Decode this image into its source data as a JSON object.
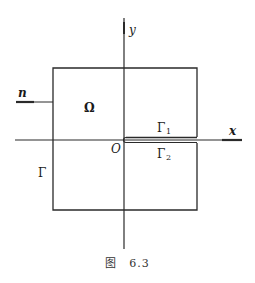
{
  "figure": {
    "caption_prefix": "图",
    "caption_number": "6.3",
    "labels": {
      "y_axis": "y",
      "x_axis": "x",
      "origin": "O",
      "domain": "Ω",
      "normal": "n",
      "boundary": "Γ",
      "upper_slit": "Γ",
      "upper_slit_sub": "1",
      "lower_slit": "Γ",
      "lower_slit_sub": "2"
    },
    "colors": {
      "line": "#2a2a2a",
      "background": "#ffffff"
    }
  }
}
